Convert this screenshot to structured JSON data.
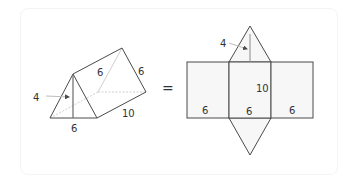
{
  "colors": {
    "line": "#4a4a4a",
    "hidden_line": "#c8c8c8",
    "face_fill": "#f6f6f6",
    "text": "#333333"
  },
  "prism": {
    "height_label": "4",
    "top_edge_label": "6",
    "slant_edge_label": "6",
    "length_label": "10",
    "base_label": "6"
  },
  "equals_sign": "=",
  "net": {
    "height_label": "4",
    "length_label": "10",
    "left_face_label": "6",
    "middle_face_label": "6",
    "right_face_label": "6"
  }
}
